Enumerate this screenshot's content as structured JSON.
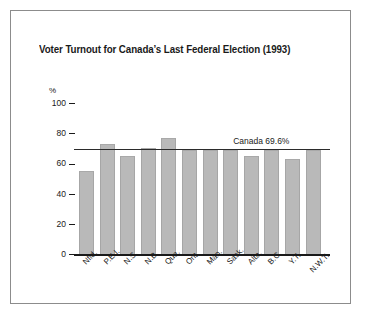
{
  "chart_data": {
    "type": "bar",
    "title": "Voter Turnout for Canada’s Last Federal Election (1993)",
    "xlabel": "",
    "ylabel": "%",
    "ylim": [
      0,
      100
    ],
    "yticks": [
      100,
      80,
      60,
      40,
      20,
      0
    ],
    "grid": false,
    "legend": null,
    "categories": [
      "Nfld.",
      "P.E.I.",
      "N.S.",
      "N.B.",
      "Que.",
      "Ont.",
      "Man.",
      "Sask.",
      "Alta.",
      "B.C.",
      "Y.T.",
      "N.W.T."
    ],
    "values": [
      55,
      73,
      65,
      70,
      77,
      69,
      69,
      69,
      65,
      69,
      63,
      69
    ],
    "annotations": [
      {
        "name": "canada-average-line",
        "label": "Canada 69.6%",
        "value": 69.6
      }
    ],
    "colors": {
      "bar_fill": "#b9b9b9",
      "bar_edge": "#a6a6a6",
      "axis": "#1a1a1a",
      "reference_line": "#2b2b2b",
      "frame": "#8c8c8c",
      "background": "#ffffff"
    }
  }
}
